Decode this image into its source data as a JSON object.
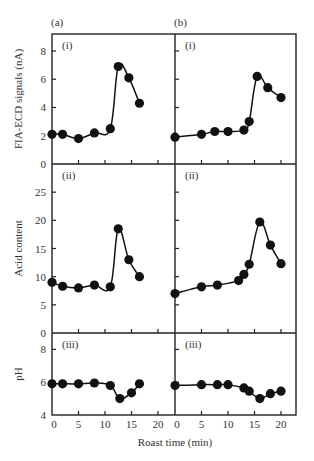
{
  "chart_data": {
    "type": "line",
    "title": "",
    "xlabel": "Roast time (min)",
    "xlim": [
      0,
      23
    ],
    "x_ticks": [
      0,
      5,
      10,
      15,
      20
    ],
    "columns": [
      {
        "label": "(a)"
      },
      {
        "label": "(b)"
      }
    ],
    "rows": [
      {
        "label": "(i)",
        "ylabel": "FIA-ECD signals (nA)",
        "ylim": [
          0,
          9.2
        ],
        "y_ticks": [
          0,
          2,
          4,
          6,
          8
        ]
      },
      {
        "label": "(ii)",
        "ylabel": "Acid content",
        "ylim": [
          0,
          30
        ],
        "y_ticks": [
          0,
          5,
          10,
          15,
          20,
          25
        ]
      },
      {
        "label": "(iii)",
        "ylabel": "pH",
        "ylim": [
          4,
          9
        ],
        "y_ticks": [
          4,
          6,
          8
        ]
      }
    ],
    "panels": [
      {
        "id": "a-i",
        "column": "(a)",
        "row": "(i)",
        "x": [
          0,
          2,
          5,
          8,
          11,
          12.5,
          14.5,
          16.5
        ],
        "y": [
          2.1,
          2.1,
          1.8,
          2.2,
          2.5,
          6.9,
          6.1,
          4.3
        ]
      },
      {
        "id": "b-i",
        "column": "(b)",
        "row": "(i)",
        "x": [
          0,
          5,
          7.5,
          10,
          13,
          14,
          15.5,
          17.5,
          20
        ],
        "y": [
          1.9,
          2.1,
          2.3,
          2.3,
          2.4,
          3.0,
          6.2,
          5.4,
          4.7
        ]
      },
      {
        "id": "a-ii",
        "column": "(a)",
        "row": "(ii)",
        "x": [
          0,
          2,
          5,
          8,
          11,
          12.5,
          14.5,
          16.5
        ],
        "y": [
          9.0,
          8.3,
          8.0,
          8.5,
          8.2,
          18.5,
          13.0,
          10.0
        ]
      },
      {
        "id": "b-ii",
        "column": "(b)",
        "row": "(ii)",
        "x": [
          0,
          5,
          8,
          12,
          13,
          14,
          16,
          18,
          20
        ],
        "y": [
          7.0,
          8.2,
          8.5,
          9.3,
          10.4,
          12.2,
          19.7,
          15.6,
          12.3
        ]
      },
      {
        "id": "a-iii",
        "column": "(a)",
        "row": "(iii)",
        "x": [
          0,
          2,
          5,
          8,
          11,
          12.8,
          15,
          16.5
        ],
        "y": [
          5.9,
          5.9,
          5.9,
          5.95,
          5.8,
          5.0,
          5.35,
          5.9
        ]
      },
      {
        "id": "b-iii",
        "column": "(b)",
        "row": "(iii)",
        "x": [
          0,
          5,
          8,
          10,
          13,
          14,
          16,
          18,
          20
        ],
        "y": [
          5.8,
          5.85,
          5.85,
          5.85,
          5.65,
          5.45,
          5.0,
          5.3,
          5.45
        ]
      }
    ],
    "grid": false,
    "legend": null
  }
}
